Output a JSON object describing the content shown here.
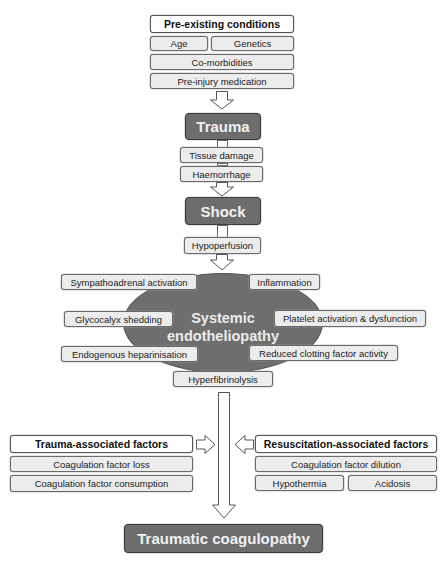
{
  "pre_existing": {
    "title": "Pre-existing conditions",
    "age": "Age",
    "genetics": "Genetics",
    "comorbidities": "Co-morbidities",
    "medication": "Pre-injury medication"
  },
  "trauma": {
    "title": "Trauma",
    "items": [
      "Tissue damage",
      "Haemorrhage"
    ]
  },
  "shock": {
    "title": "Shock",
    "items": [
      "Hypoperfusion"
    ]
  },
  "endotheliopathy": {
    "title_line1": "Systemic",
    "title_line2": "endotheliopathy",
    "items": {
      "sympathoadrenal": "Sympathoadrenal activation",
      "inflammation": "Inflammation",
      "glycocalyx": "Glycocalyx shedding",
      "platelet": "Platelet activation & dysfunction",
      "heparinisation": "Endogenous heparinisation",
      "clotting": "Reduced clotting factor activity",
      "hyperfibrinolysis": "Hyperfibrinolysis"
    }
  },
  "trauma_factors": {
    "title": "Trauma-associated factors",
    "items": [
      "Coagulation factor loss",
      "Coagulation factor consumption"
    ]
  },
  "resuscitation_factors": {
    "title": "Resuscitation-associated factors",
    "dilution": "Coagulation factor dilution",
    "hypothermia": "Hypothermia",
    "acidosis": "Acidosis"
  },
  "outcome": {
    "title": "Traumatic coagulopathy"
  },
  "colors": {
    "dark_box": "#6d6d6d",
    "light_box": "#ececec",
    "header_box": "#ffffff",
    "ellipse": "#6e6e6e"
  }
}
